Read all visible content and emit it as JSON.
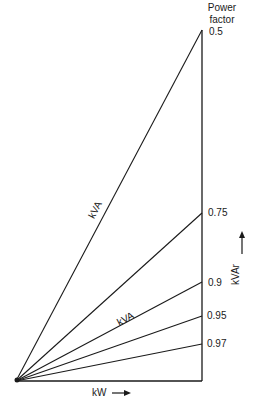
{
  "diagram": {
    "title_line1": "Power",
    "title_line2": "factor",
    "vertical_axis_label": "kVAr",
    "horizontal_axis_label": "kW",
    "hypotenuse_labels": [
      "kVA",
      "kVA"
    ],
    "power_factors": [
      {
        "label": "0.5",
        "y": 30
      },
      {
        "label": "0.75",
        "y": 213
      },
      {
        "label": "0.9",
        "y": 282
      },
      {
        "label": "0.95",
        "y": 316
      },
      {
        "label": "0.97",
        "y": 344
      }
    ],
    "line_color": "#1a1a1a"
  }
}
